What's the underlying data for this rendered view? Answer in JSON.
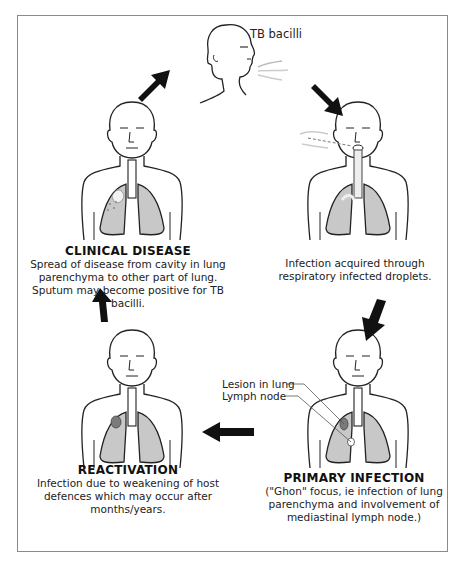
{
  "diagram": {
    "colors": {
      "lung_fill": "#c8c8c8",
      "lesion_fill": "#7a7a7a",
      "line": "#222222",
      "arrow": "#111111",
      "border": "#8a8a8a"
    },
    "source": {
      "label": "TB bacilli"
    },
    "stages": [
      {
        "id": "infection",
        "title": "",
        "description": "Infection acquired through respiratory infected droplets."
      },
      {
        "id": "primary_infection",
        "title": "PRIMARY INFECTION",
        "description": "(\"Ghon\" focus, ie infection of lung parenchyma and involvement of mediastinal lymph node.)",
        "annotations": [
          "Lesion in lung",
          "Lymph node"
        ]
      },
      {
        "id": "reactivation",
        "title": "REACTIVATION",
        "description": "Infection due to weakening of host defences which may occur after months/years."
      },
      {
        "id": "clinical_disease",
        "title": "CLINICAL DISEASE",
        "description": "Spread of disease from cavity in lung parenchyma to other part of lung. Sputum may become positive for TB bacilli."
      }
    ],
    "arrows": [
      {
        "from": "clinical_disease",
        "to": "source",
        "direction": "up-right"
      },
      {
        "from": "source",
        "to": "infection",
        "direction": "down-right"
      },
      {
        "from": "infection",
        "to": "primary_infection",
        "direction": "down-left"
      },
      {
        "from": "primary_infection",
        "to": "reactivation",
        "direction": "left"
      },
      {
        "from": "reactivation",
        "to": "clinical_disease",
        "direction": "up"
      }
    ]
  }
}
